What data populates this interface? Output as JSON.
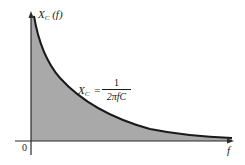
{
  "diagram": {
    "y_axis_label": {
      "symbol": "X",
      "subscript": "C",
      "arg": "(f)"
    },
    "x_axis_label": "f",
    "origin_label": "0",
    "formula": {
      "lhs_symbol": "X",
      "lhs_subscript": "C",
      "equals": "=",
      "numerator": "1",
      "denominator": "2πfC"
    },
    "colors": {
      "fill": "#a9a9a9",
      "curve": "#1a1a1a",
      "axis": "#2a2a2a",
      "background": "#ffffff"
    }
  }
}
